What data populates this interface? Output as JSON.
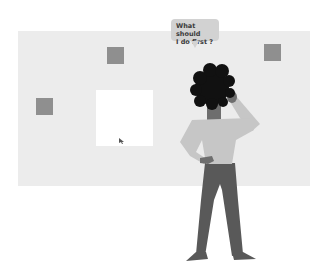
{
  "illustration": {
    "speech_bubble": {
      "line1": "What should",
      "line2": "I do first ?"
    },
    "colors": {
      "board": "#ececec",
      "square": "#8f8f8f",
      "panel": "#ffffff",
      "bubble": "#d2d2d2",
      "hair": "#111111",
      "skin": "#6e6e6e",
      "shirt": "#c6c6c6",
      "pants": "#595959"
    }
  }
}
